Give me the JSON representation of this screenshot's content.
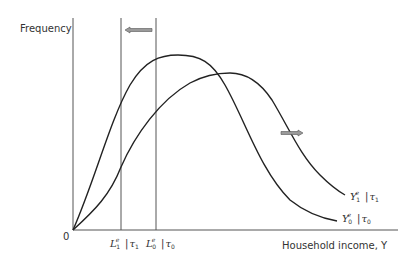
{
  "diagram": {
    "y_axis_label": "Frequency",
    "x_axis_label": "Household income, Y",
    "origin_label": "0",
    "markers": [
      {
        "base": "L",
        "sub": "1",
        "sup": "e",
        "cond": "τ",
        "cond_sub": "1"
      },
      {
        "base": "L",
        "sub": "0",
        "sup": "e",
        "cond": "τ",
        "cond_sub": "0"
      }
    ],
    "curves": [
      {
        "base": "Y",
        "sub": "1",
        "sup": "e",
        "cond": "τ",
        "cond_sub": "1"
      },
      {
        "base": "Y",
        "sub": "0",
        "sup": "e",
        "cond": "τ",
        "cond_sub": "0"
      }
    ],
    "arrows": [
      {
        "name": "shift-left-arrow",
        "direction": "left"
      },
      {
        "name": "shift-right-arrow",
        "direction": "right"
      }
    ],
    "colors": {
      "line": "#222222",
      "arrow_fill": "#9a9a9a",
      "arrow_stroke": "#555555"
    }
  }
}
